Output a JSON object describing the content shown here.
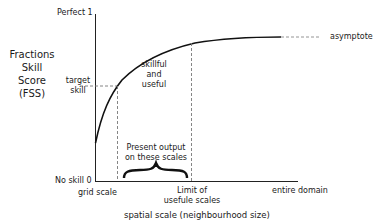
{
  "diagram": {
    "y_axis_title": [
      "Fractions",
      "Skill",
      "Score",
      "(FSS)"
    ],
    "x_axis_title": "spatial scale (neighbourhood size)",
    "y_labels": {
      "top": "Perfect 1",
      "bottom": "No skill 0",
      "target": [
        "target",
        "skill"
      ]
    },
    "x_labels": {
      "left": "grid scale",
      "limit": [
        "Limit of",
        "usefule scales"
      ],
      "right": "entire domain"
    },
    "annotations": {
      "asymptote": "asymptote",
      "region": [
        "skillful",
        "and",
        "useful"
      ],
      "present": [
        "Present output",
        "on these scales"
      ]
    },
    "colors": {
      "line": "#111111",
      "dashed": "#777777",
      "text": "#1a1a1a"
    }
  }
}
